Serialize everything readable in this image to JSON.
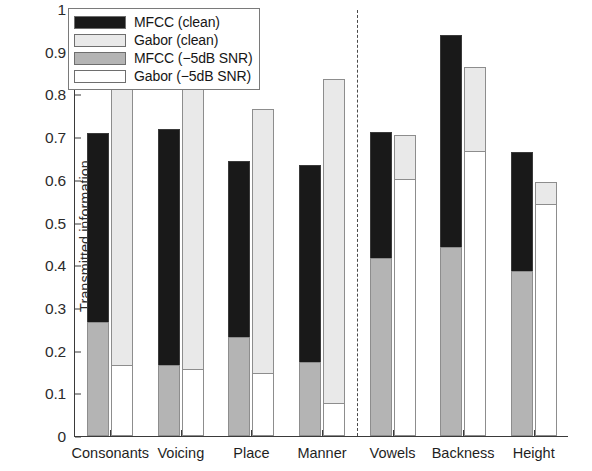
{
  "chart_data": {
    "type": "bar",
    "title": "",
    "subtitle": "",
    "xlabel": "",
    "ylabel": "Transmitted information",
    "ylim": [
      0,
      1
    ],
    "yticks": [
      0,
      0.1,
      0.2,
      0.3,
      0.4,
      0.5,
      0.6,
      0.7,
      0.8,
      0.9,
      1
    ],
    "ytick_labels": [
      "0",
      "0.1",
      "0.2",
      "0.3",
      "0.4",
      "0.5",
      "0.6",
      "0.7",
      "0.8",
      "0.9",
      "1"
    ],
    "grid": false,
    "legend_position": "top-left",
    "stacked": true,
    "categories": [
      "Consonants",
      "Voicing",
      "Place",
      "Manner",
      "Vowels",
      "Backness",
      "Height"
    ],
    "series": [
      {
        "name": "MFCC (clean)",
        "color": "#191919",
        "values": [
          0.71,
          0.72,
          0.645,
          0.635,
          0.712,
          0.94,
          0.665
        ]
      },
      {
        "name": "Gabor (clean)",
        "color": "#e9e9e9",
        "values": [
          0.815,
          0.83,
          0.765,
          0.835,
          0.705,
          0.865,
          0.595
        ]
      },
      {
        "name": "MFCC (−5dB SNR)",
        "color": "#b4b4b4",
        "values": [
          0.265,
          0.165,
          0.23,
          0.17,
          0.415,
          0.44,
          0.385
        ]
      },
      {
        "name": "Gabor (−5dB SNR)",
        "color": "#ffffff",
        "values": [
          0.165,
          0.155,
          0.145,
          0.075,
          0.6,
          0.665,
          0.54
        ]
      }
    ],
    "annotations": [
      {
        "type": "vertical-dashed-divider",
        "between": [
          "Manner",
          "Vowels"
        ],
        "note": "separates consonant features from vowel features"
      }
    ]
  },
  "legend": {
    "items": [
      {
        "label": "MFCC (clean)",
        "swatch": "#191919"
      },
      {
        "label": "Gabor (clean)",
        "swatch": "#e9e9e9"
      },
      {
        "label": "MFCC (−5dB SNR)",
        "swatch": "#b4b4b4"
      },
      {
        "label": "Gabor (−5dB SNR)",
        "swatch": "#ffffff"
      }
    ]
  },
  "axes": {
    "y_title": "Transmitted information"
  }
}
